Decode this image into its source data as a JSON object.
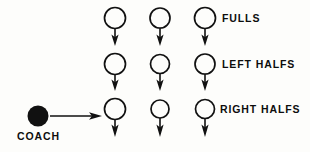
{
  "diagram": {
    "kind": "pool-drill-formation",
    "canvas": {
      "width": 310,
      "height": 152,
      "background": "#fdfdfb"
    },
    "stroke_color": "#111111",
    "fill_color": "#111111",
    "rows": [
      {
        "label": "FULLS",
        "label_x": 222,
        "label_y": 14,
        "circle_cy": 18,
        "circles": [
          {
            "cx": 115,
            "r": 10.5
          },
          {
            "cx": 160,
            "r": 10.0
          },
          {
            "cx": 205,
            "r": 10.5
          }
        ],
        "arrow_from_y": 29,
        "arrow_to_y": 45
      },
      {
        "label": "LEFT HALFS",
        "label_x": 222,
        "label_y": 60,
        "circle_cy": 64,
        "circles": [
          {
            "cx": 115,
            "r": 10.5
          },
          {
            "cx": 160,
            "r": 9.5
          },
          {
            "cx": 205,
            "r": 10.0
          }
        ],
        "arrow_from_y": 74,
        "arrow_to_y": 90
      },
      {
        "label": "RIGHT HALFS",
        "label_x": 222,
        "label_y": 106,
        "circle_cy": 109,
        "circles": [
          {
            "cx": 115,
            "r": 10.5
          },
          {
            "cx": 160,
            "r": 9.0
          },
          {
            "cx": 205,
            "r": 9.5
          }
        ],
        "arrow_from_y": 119,
        "arrow_to_y": 136
      }
    ],
    "coach": {
      "label": "COACH",
      "label_x": 18,
      "label_y": 131,
      "dot": {
        "cx": 38,
        "cy": 116,
        "r": 10.5
      },
      "arrow": {
        "x1": 50,
        "y1": 116,
        "x2": 101,
        "y2": 116
      }
    }
  }
}
